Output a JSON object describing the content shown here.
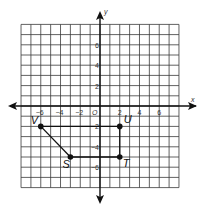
{
  "figure": {
    "type": "coordinate-grid",
    "grid": {
      "xmin": -8,
      "xmax": 8,
      "ymin": -8,
      "ymax": 8
    },
    "axes": {
      "x_label": "x",
      "y_label": "y",
      "origin_label": "O"
    },
    "x_ticks": [
      {
        "value": -6,
        "label": "−6"
      },
      {
        "value": -4,
        "label": "−4"
      },
      {
        "value": -2,
        "label": "−2"
      },
      {
        "value": 2,
        "label": "2"
      },
      {
        "value": 4,
        "label": "4"
      },
      {
        "value": 6,
        "label": "6"
      }
    ],
    "y_ticks": [
      {
        "value": 6,
        "label": "6"
      },
      {
        "value": 4,
        "label": "4"
      },
      {
        "value": 2,
        "label": "2"
      },
      {
        "value": -2,
        "label": "−2"
      },
      {
        "value": -4,
        "label": "−4"
      },
      {
        "value": -6,
        "label": "−6"
      }
    ],
    "points": [
      {
        "name": "V",
        "x": -6,
        "y": -2
      },
      {
        "name": "U",
        "x": 2,
        "y": -2
      },
      {
        "name": "T",
        "x": 2,
        "y": -5
      },
      {
        "name": "S",
        "x": -3,
        "y": -5
      }
    ],
    "polygon_order": [
      "V",
      "U",
      "T",
      "S"
    ],
    "colors": {
      "grid": "#3a3a3a",
      "axis": "#111111",
      "point": "#111111"
    }
  }
}
